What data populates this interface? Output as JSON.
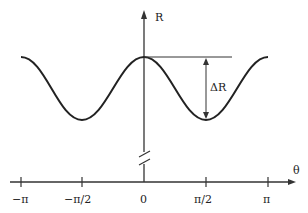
{
  "diagram": {
    "y_axis_label": "R",
    "x_axis_label": "θ",
    "delta_label": "ΔR",
    "x_ticks": [
      "−π",
      "−π/2",
      "0",
      "π/2",
      "π"
    ],
    "curve": "R(θ) = R0 − (ΔR/2)(1 − cos 2θ), maxima at −π, 0, π; minima at −π/2, π/2",
    "axis_break": true,
    "colors": {
      "line": "#222222",
      "background": "#ffffff"
    }
  }
}
